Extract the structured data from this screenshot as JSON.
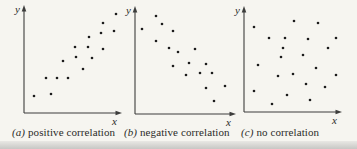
{
  "figure": {
    "axis_labels": {
      "x": "x",
      "y": "y"
    },
    "background_color": "#f6f5f0",
    "dot_color": "#1c1c1c",
    "axis_color": "#3d3d3c"
  },
  "chart_data": [
    {
      "type": "scatter",
      "caption_letter": "(a)",
      "caption_text": "positive correlation",
      "xlabel": "x",
      "ylabel": "y",
      "trend": "positive",
      "axes_note": "unlabeled axes with arrowheads, no ticks",
      "x_range": [
        0,
        100
      ],
      "y_range": [
        0,
        100
      ],
      "points": [
        [
          97.9,
          95.2
        ],
        [
          84.0,
          86.5
        ],
        [
          95.7,
          78.8
        ],
        [
          81.9,
          76.9
        ],
        [
          69.1,
          73.1
        ],
        [
          54.3,
          63.5
        ],
        [
          68.1,
          63.5
        ],
        [
          84.0,
          61.5
        ],
        [
          72.3,
          52.9
        ],
        [
          55.3,
          53.8
        ],
        [
          41.5,
          50.0
        ],
        [
          62.8,
          42.3
        ],
        [
          23.4,
          33.7
        ],
        [
          35.1,
          33.7
        ],
        [
          46.8,
          33.7
        ],
        [
          10.6,
          16.3
        ],
        [
          28.7,
          18.3
        ]
      ]
    },
    {
      "type": "scatter",
      "caption_letter": "(b)",
      "caption_text": "negative correlation",
      "xlabel": "x",
      "ylabel": "y",
      "trend": "negative",
      "axes_note": "unlabeled axes with arrowheads, no ticks",
      "x_range": [
        0,
        100
      ],
      "y_range": [
        0,
        100
      ],
      "points": [
        [
          21.6,
          94.2
        ],
        [
          27.8,
          86.5
        ],
        [
          7.2,
          81.7
        ],
        [
          39.2,
          79.8
        ],
        [
          21.6,
          70.2
        ],
        [
          35.1,
          63.5
        ],
        [
          44.3,
          59.6
        ],
        [
          61.9,
          62.5
        ],
        [
          39.2,
          46.2
        ],
        [
          55.7,
          49.0
        ],
        [
          73.2,
          48.1
        ],
        [
          52.6,
          37.5
        ],
        [
          67.0,
          39.4
        ],
        [
          79.4,
          39.4
        ],
        [
          73.2,
          25.0
        ],
        [
          92.8,
          26.9
        ],
        [
          81.4,
          12.5
        ]
      ]
    },
    {
      "type": "scatter",
      "caption_letter": "(c)",
      "caption_text": "no correlation",
      "xlabel": "x",
      "ylabel": "y",
      "trend": "none",
      "axes_note": "unlabeled axes with arrowheads, no ticks",
      "x_range": [
        0,
        100
      ],
      "y_range": [
        0,
        100
      ],
      "points": [
        [
          10.6,
          83.3
        ],
        [
          53.2,
          89.2
        ],
        [
          78.7,
          87.3
        ],
        [
          26.6,
          72.5
        ],
        [
          43.6,
          72.5
        ],
        [
          68.1,
          71.6
        ],
        [
          97.9,
          72.5
        ],
        [
          41.5,
          62.7
        ],
        [
          89.4,
          62.7
        ],
        [
          39.4,
          53.9
        ],
        [
          62.8,
          55.9
        ],
        [
          14.9,
          46.1
        ],
        [
          76.6,
          43.1
        ],
        [
          36.2,
          35.3
        ],
        [
          52.1,
          37.3
        ],
        [
          97.9,
          36.3
        ],
        [
          66.0,
          27.5
        ],
        [
          86.2,
          24.5
        ],
        [
          10.6,
          20.6
        ],
        [
          45.7,
          16.7
        ],
        [
          70.2,
          11.8
        ],
        [
          29.8,
          7.8
        ]
      ]
    }
  ]
}
